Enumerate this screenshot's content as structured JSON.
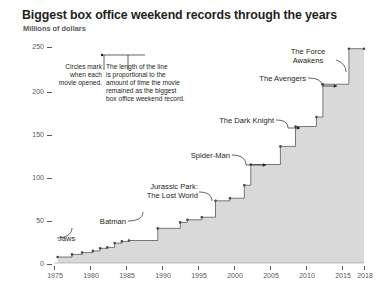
{
  "header": {
    "title": "Biggest box office weekend records through the years",
    "subtitle": "Millions of dollars"
  },
  "notes": {
    "circles_note": "Circles mark\nwhen each\nmovie opened.",
    "circles_note_lines": [
      "Circles mark",
      "when each",
      "movie opened."
    ],
    "length_note_lines": [
      "The length of the line",
      "is proportional to the",
      "amount of time the movie",
      "remained as the biggest",
      "box office weekend record."
    ]
  },
  "chart_data": {
    "type": "line",
    "title": "Biggest box office weekend records through the years",
    "subtitle": "Millions of dollars",
    "xlabel": "",
    "ylabel": "Millions of dollars",
    "xlim": [
      1974,
      2018
    ],
    "ylim": [
      0,
      250
    ],
    "yticks": [
      0,
      50,
      100,
      150,
      200,
      250
    ],
    "xticks": [
      1975,
      1980,
      1985,
      1990,
      1995,
      2000,
      2005,
      2010,
      2015,
      2018
    ],
    "grid": false,
    "legend": false,
    "series": [
      {
        "name": "Biggest box office weekend record",
        "style": "step-area",
        "points": [
          {
            "year": 1975.5,
            "value": 7,
            "label": "Jaws"
          },
          {
            "year": 1977.5,
            "value": 10,
            "label": ""
          },
          {
            "year": 1978.9,
            "value": 12,
            "label": ""
          },
          {
            "year": 1980.4,
            "value": 14,
            "label": ""
          },
          {
            "year": 1981.4,
            "value": 17,
            "label": ""
          },
          {
            "year": 1982.4,
            "value": 18,
            "label": ""
          },
          {
            "year": 1983.4,
            "value": 23,
            "label": ""
          },
          {
            "year": 1984.4,
            "value": 25,
            "label": ""
          },
          {
            "year": 1985.4,
            "value": 26,
            "label": ""
          },
          {
            "year": 1989.4,
            "value": 40,
            "label": "Batman"
          },
          {
            "year": 1992.5,
            "value": 47,
            "label": ""
          },
          {
            "year": 1993.5,
            "value": 50,
            "label": ""
          },
          {
            "year": 1995.5,
            "value": 53,
            "label": ""
          },
          {
            "year": 1997.4,
            "value": 72,
            "label": "Jurassic Park: The Lost World"
          },
          {
            "year": 1999.4,
            "value": 75,
            "label": ""
          },
          {
            "year": 2001.4,
            "value": 90,
            "label": ""
          },
          {
            "year": 2002.3,
            "value": 114,
            "label": "Spider-Man"
          },
          {
            "year": 2006.4,
            "value": 135,
            "label": ""
          },
          {
            "year": 2008.5,
            "value": 158,
            "label": "The Dark Knight"
          },
          {
            "year": 2011.4,
            "value": 169,
            "label": ""
          },
          {
            "year": 2012.3,
            "value": 207,
            "label": "The Avengers"
          },
          {
            "year": 2015.9,
            "value": 248,
            "label": "The Force Awakens"
          },
          {
            "year": 2018.0,
            "value": 248,
            "label": ""
          }
        ]
      }
    ],
    "annotations": [
      {
        "label": "Jaws",
        "year": 1975.5,
        "value": 7
      },
      {
        "label": "Batman",
        "year": 1989.4,
        "value": 40
      },
      {
        "label": "Jurassic Park:",
        "label2": "The Lost World",
        "year": 1997.4,
        "value": 72
      },
      {
        "label": "Spider-Man",
        "year": 2002.3,
        "value": 114
      },
      {
        "label": "The Dark Knight",
        "year": 2008.5,
        "value": 158
      },
      {
        "label": "The Avengers",
        "year": 2012.3,
        "value": 207
      },
      {
        "label": "The Force",
        "label2": "Awakens",
        "year": 2015.9,
        "value": 248
      }
    ]
  },
  "axis": {
    "y_labels": [
      "250",
      "200",
      "150",
      "100",
      "50",
      "0"
    ],
    "x_labels": [
      "1975",
      "1980",
      "1985",
      "1990",
      "1995",
      "2000",
      "2005",
      "2010",
      "2015",
      "2018"
    ]
  },
  "labels": {
    "jaws": "Jaws",
    "batman": "Batman",
    "jurassic_1": "Jurassic Park:",
    "jurassic_2": "The Lost World",
    "spiderman": "Spider-Man",
    "dark_knight": "The Dark Knight",
    "avengers": "The Avengers",
    "force_1": "The Force",
    "force_2": "Awakens"
  },
  "colors": {
    "area_fill": "#d9d9d9",
    "line": "#58595b",
    "text": "#231f20",
    "axis_text": "#58595b"
  }
}
